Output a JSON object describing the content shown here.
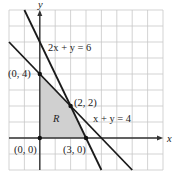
{
  "chart_data": {
    "type": "line",
    "title": "",
    "xlabel": "x",
    "ylabel": "y",
    "xlim": [
      -2,
      8
    ],
    "ylim": [
      -2,
      8
    ],
    "grid": true,
    "grid_step": 1,
    "series": [
      {
        "name": "2x + y = 6",
        "equation": "2x + y = 6",
        "points": [
          [
            -1.0,
            8.0
          ],
          [
            4.0,
            -2.0
          ]
        ]
      },
      {
        "name": "x + y = 4",
        "equation": "x + y = 4",
        "points": [
          [
            -2.0,
            6.0
          ],
          [
            6.0,
            -2.0
          ]
        ]
      }
    ],
    "feasible_region": {
      "label": "R",
      "vertices": [
        [
          0,
          0
        ],
        [
          0,
          4
        ],
        [
          2,
          2
        ],
        [
          3,
          0
        ]
      ],
      "fill": "#d0d0d0"
    },
    "points": [
      {
        "x": 0,
        "y": 0,
        "label": "(0, 0)"
      },
      {
        "x": 0,
        "y": 4,
        "label": "(0, 4)"
      },
      {
        "x": 2,
        "y": 2,
        "label": "(2, 2)"
      },
      {
        "x": 3,
        "y": 0,
        "label": "(3, 0)"
      }
    ],
    "annotations": [
      "2x + y = 6",
      "x + y = 4",
      "R"
    ]
  },
  "labels": {
    "x_axis": "x",
    "y_axis": "y",
    "line1": "2x + y = 6",
    "line2": "x + y = 4",
    "region": "R",
    "p00": "(0, 0)",
    "p04": "(0, 4)",
    "p22": "(2, 2)",
    "p30": "(3, 0)"
  }
}
